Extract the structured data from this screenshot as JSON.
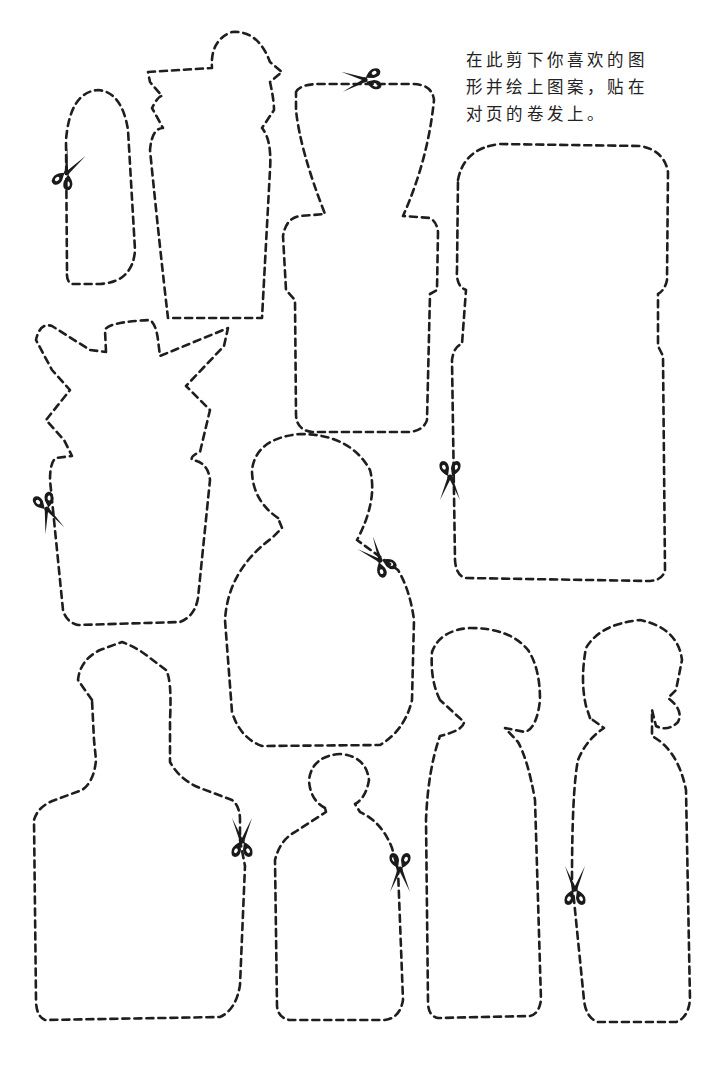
{
  "instruction": {
    "line1": "在此剪下你喜欢的图",
    "line2": "形并绘上图案，贴在",
    "line3": "对页的卷发上。"
  },
  "colors": {
    "background": "#ffffff",
    "ink": "#1e1e1e"
  },
  "shapes": [
    {
      "name": "tall-rounded-tab"
    },
    {
      "name": "bottle-with-knob"
    },
    {
      "name": "hourglass-block"
    },
    {
      "name": "large-rounded-panel"
    },
    {
      "name": "star-top-vase"
    },
    {
      "name": "snowman-figure"
    },
    {
      "name": "bust-silhouette"
    },
    {
      "name": "small-head-figure"
    },
    {
      "name": "profile-figure-left"
    },
    {
      "name": "profile-figure-right"
    }
  ],
  "scissors_count": 9
}
